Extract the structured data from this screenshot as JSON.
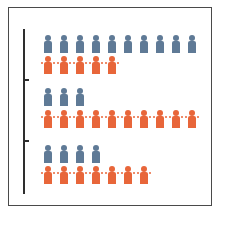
{
  "chart_data": {
    "type": "pictograph",
    "title": "",
    "caption": "",
    "groups": [
      {
        "name": "Group 1",
        "series": [
          {
            "name": "blue",
            "count": 10
          },
          {
            "name": "orange",
            "count": 5
          }
        ]
      },
      {
        "name": "Group 2",
        "series": [
          {
            "name": "blue",
            "count": 3
          },
          {
            "name": "orange",
            "count": 10
          }
        ]
      },
      {
        "name": "Group 3",
        "series": [
          {
            "name": "blue",
            "count": 4
          },
          {
            "name": "orange",
            "count": 7
          }
        ]
      }
    ],
    "series_colors": {
      "blue": "#5f7a96",
      "orange": "#e8663a"
    },
    "axis": {
      "orientation": "vertical",
      "ticks": 2,
      "labels": []
    },
    "legend": null,
    "grid": false
  },
  "colors": {
    "blue": "#5f7a96",
    "orange": "#e8663a",
    "frame": "#4a4a4a",
    "axis": "#2e2e2e",
    "caption": "#e0405a"
  },
  "caption_text": ""
}
